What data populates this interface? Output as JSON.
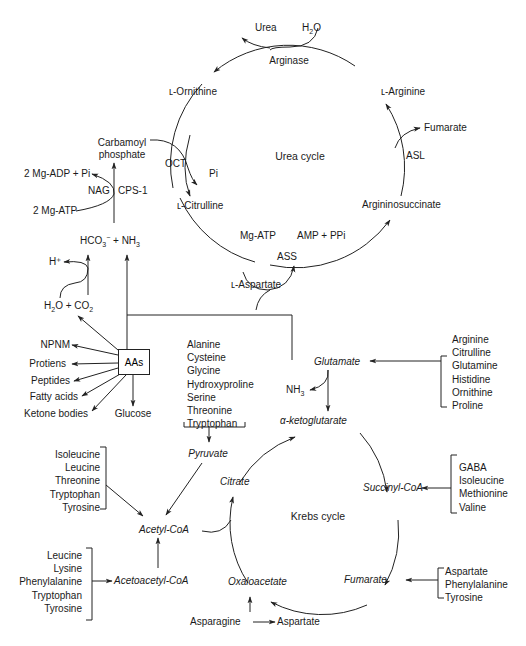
{
  "urea_cycle": {
    "title": "Urea cycle",
    "nodes": {
      "urea": "Urea",
      "h2o_main": "H",
      "h2o_sub": "2",
      "h2o_end": "O",
      "arginase": "Arginase",
      "ornithine": "ʟ-Ornithine",
      "arginine": "ʟ-Arginine",
      "fumarate": "Fumarate",
      "asl": "ASL",
      "argininosuccinate": "Argininosuccinate",
      "carbamoyl_1": "Carbamoyl",
      "carbamoyl_2": "phosphate",
      "oct": "OCT",
      "pi": "Pi",
      "citrulline": "ʟ-Citrulline",
      "mg_atp": "Mg-ATP",
      "amp_ppi": "AMP + PPi",
      "ass": "ASS",
      "aspartate": "ʟ-Aspartate"
    }
  },
  "cps": {
    "adp": "2 Mg-ADP + Pi",
    "nag": "NAG",
    "cps1": "CPS-1",
    "atp": "2 Mg-ATP",
    "hco3": "HCO",
    "hco3_sub": "3",
    "hco3_sup": "−",
    "plus_nh3": " + NH",
    "nh3_sub": "3",
    "h_plus": "H⁺",
    "h2o_co2_a": "H",
    "h2o_co2_sub1": "2",
    "h2o_co2_b": "O + CO",
    "h2o_co2_sub2": "2"
  },
  "aas": {
    "label": "AAs",
    "outputs": [
      "NPNM",
      "Protiens",
      "Peptides",
      "Fatty acids",
      "Ketone bodies",
      "Glucose"
    ]
  },
  "pyruvate_group": {
    "items": [
      "Alanine",
      "Cysteine",
      "Glycine",
      "Hydroxyproline",
      "Serine",
      "Threonine",
      "Tryptophan"
    ],
    "target": "Pyruvate"
  },
  "glutamate_group": {
    "items": [
      "Arginine",
      "Citrulline",
      "Glutamine",
      "Histidine",
      "Ornithine",
      "Proline"
    ],
    "target": "Glutamate",
    "nh3": "NH",
    "nh3_sub": "3"
  },
  "krebs_cycle": {
    "title": "Krebs cycle",
    "nodes": {
      "akg": "α-ketoglutarate",
      "succinyl": "Succinyl-CoA",
      "fumarate": "Fumarate",
      "oxaloacetate": "Oxaloacetate",
      "citrate": "Citrate"
    }
  },
  "acetyl_group": {
    "items": [
      "Isoleucine",
      "Leucine",
      "Threonine",
      "Tryptophan",
      "Tyrosine"
    ],
    "target": "Acetyl-CoA"
  },
  "acetoacetyl_group": {
    "items": [
      "Leucine",
      "Lysine",
      "Phenylalanine",
      "Tryptophan",
      "Tyrosine"
    ],
    "target": "Acetoacetyl-CoA"
  },
  "succinyl_group": {
    "items": [
      "GABA",
      "Isoleucine",
      "Methionine",
      "Valine"
    ]
  },
  "fumarate_group": {
    "items": [
      "Aspartate",
      "Phenylalanine",
      "Tyrosine"
    ]
  },
  "asparagine": {
    "source": "Asparagine",
    "target": "Aspartate"
  }
}
